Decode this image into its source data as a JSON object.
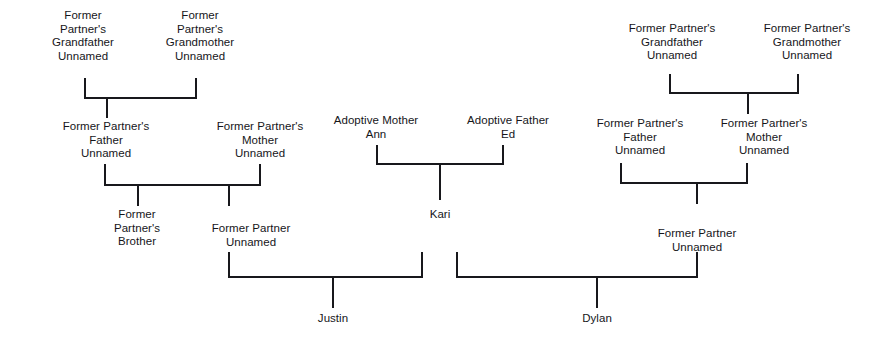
{
  "diagram": {
    "type": "family-tree",
    "orientation": "top-down"
  },
  "nodes": {
    "left_grandfather": "Former\nPartner's\nGrandfather\nUnnamed",
    "left_grandmother": "Former\nPartner's\nGrandmother\nUnnamed",
    "left_father": "Former Partner's\nFather\nUnnamed",
    "left_mother": "Former Partner's\nMother\nUnnamed",
    "left_brother": "Former\nPartner's\nBrother",
    "left_former_partner": "Former Partner\nUnnamed",
    "adoptive_mother": "Adoptive Mother\nAnn",
    "adoptive_father": "Adoptive Father\nEd",
    "kari": "Kari",
    "right_grandfather": "Former Partner's\nGrandfather\nUnnamed",
    "right_grandmother": "Former Partner's\nGrandmother\nUnnamed",
    "right_father": "Former Partner's\nFather\nUnnamed",
    "right_mother": "Former Partner's\nMother\nUnnamed",
    "right_former_partner": "Former Partner\nUnnamed",
    "justin": "Justin",
    "dylan": "Dylan"
  },
  "colors": {
    "ink": "#18181c",
    "text": "#16161a",
    "background": "#ffffff"
  }
}
